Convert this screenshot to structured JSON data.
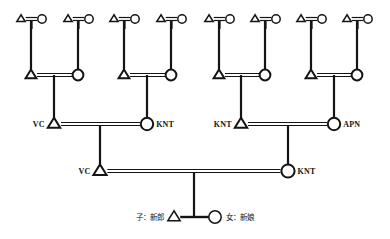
{
  "diagram": {
    "symbols": {
      "male": "triangle",
      "female": "circle",
      "marriage": "double-horizontal-line",
      "descent": "vertical-line"
    },
    "canvas": {
      "width": 390,
      "height": 239
    },
    "generations": [
      {
        "id": "gen-1",
        "y": 19,
        "couples": [
          {
            "id": "g1-c1",
            "male_x": 21,
            "female_x": 42,
            "child_x": 31,
            "child_y": 75
          },
          {
            "id": "g1-c2",
            "male_x": 68,
            "female_x": 89,
            "child_x": 78,
            "child_y": 75
          },
          {
            "id": "g1-c3",
            "male_x": 114,
            "female_x": 135,
            "child_x": 124,
            "child_y": 75
          },
          {
            "id": "g1-c4",
            "male_x": 161,
            "female_x": 182,
            "child_x": 171,
            "child_y": 75
          },
          {
            "id": "g1-c5",
            "male_x": 209,
            "female_x": 230,
            "child_x": 219,
            "child_y": 75
          },
          {
            "id": "g1-c6",
            "male_x": 255,
            "female_x": 276,
            "child_x": 265,
            "child_y": 75
          },
          {
            "id": "g1-c7",
            "male_x": 301,
            "female_x": 322,
            "child_x": 311,
            "child_y": 75
          },
          {
            "id": "g1-c8",
            "male_x": 347,
            "female_x": 368,
            "child_x": 357,
            "child_y": 75
          }
        ]
      },
      {
        "id": "gen-2",
        "y": 75,
        "couples": [
          {
            "id": "g2-c1",
            "male_x": 31,
            "female_x": 78,
            "sib_x": 54,
            "child_x": 54,
            "child_y": 124
          },
          {
            "id": "g2-c2",
            "male_x": 124,
            "female_x": 171,
            "sib_x": 147,
            "child_x": 147,
            "child_y": 124
          },
          {
            "id": "g2-c3",
            "male_x": 219,
            "female_x": 265,
            "sib_x": 241,
            "child_x": 241,
            "child_y": 124
          },
          {
            "id": "g2-c4",
            "male_x": 311,
            "female_x": 357,
            "sib_x": 334,
            "child_x": 334,
            "child_y": 124
          }
        ]
      },
      {
        "id": "gen-3",
        "y": 124,
        "couples": [
          {
            "id": "g3-c1",
            "male_x": 54,
            "female_x": 147,
            "male_label": "VC",
            "female_label": "KNT",
            "child_x": 100,
            "child_y": 171
          },
          {
            "id": "g3-c2",
            "male_x": 241,
            "female_x": 334,
            "male_label": "KNT",
            "female_label": "APN",
            "child_x": 288,
            "child_y": 171
          }
        ]
      },
      {
        "id": "gen-4",
        "y": 171,
        "couples": [
          {
            "id": "g4-c1",
            "male_x": 100,
            "female_x": 288,
            "male_label": "VC",
            "female_label": "KNT",
            "child_x": 194,
            "child_y": 217
          }
        ]
      },
      {
        "id": "gen-5",
        "y": 217,
        "couples": [
          {
            "id": "g5-c1",
            "male_x": 174,
            "female_x": 215,
            "male_label": "子：新郎",
            "female_label": "女：新娘",
            "marriage_style": "solid"
          }
        ]
      }
    ],
    "labels": {
      "gen3_left_male": "VC",
      "gen3_left_female": "KNT",
      "gen3_right_male": "KNT",
      "gen3_right_female": "APN",
      "gen4_male": "VC",
      "gen4_female": "KNT",
      "gen5_male": "子：新郎",
      "gen5_female": "女：新娘"
    },
    "colors": {
      "ink": "#141414",
      "background": "#ffffff"
    }
  }
}
